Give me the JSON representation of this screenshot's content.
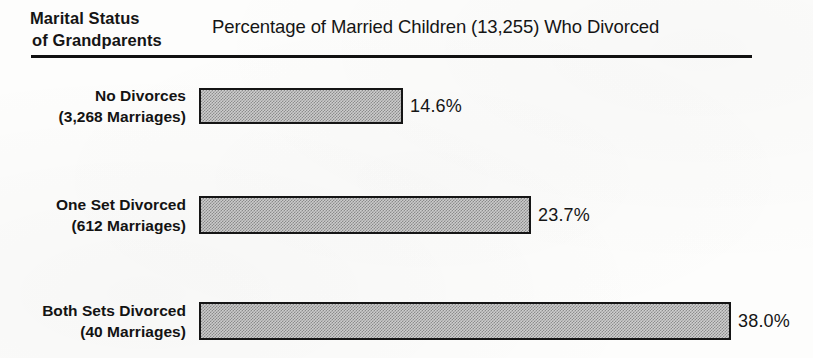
{
  "figure": {
    "row_header": {
      "line1": "Marital Status",
      "line2": "of Grandparents"
    },
    "value_header": "Percentage of Married Children (13,255) Who Divorced",
    "rows": [
      {
        "label_line1": "No Divorces",
        "label_line2": "(3,268 Marriages)",
        "value_label": "14.6%"
      },
      {
        "label_line1": "One Set Divorced",
        "label_line2": "(612 Marriages)",
        "value_label": "23.7%"
      },
      {
        "label_line1": "Both Sets Divorced",
        "label_line2": "(40 Marriages)",
        "value_label": "38.0%"
      }
    ]
  },
  "chart_data": {
    "type": "bar",
    "orientation": "horizontal",
    "title": "Percentage of Married Children (13,255) Who Divorced",
    "category_axis_title": "Marital Status of Grandparents",
    "xlabel": "Percentage of Married Children (13,255) Who Divorced",
    "ylabel": "Marital Status of Grandparents",
    "categories": [
      "No Divorces (3,268 Marriages)",
      "One Set Divorced (612 Marriages)",
      "Both Sets Divorced (40 Marriages)"
    ],
    "values": [
      14.6,
      23.7,
      38.0
    ],
    "data_labels": [
      "14.6%",
      "23.7%",
      "38.0%"
    ],
    "group_sizes": [
      3268,
      612,
      40
    ],
    "total_married_children": 13255,
    "units": "percent",
    "xlim": [
      0,
      38.0
    ],
    "grid": false,
    "legend": "none",
    "colors": {
      "bar_fill": "#cfcfcf",
      "bar_pattern": "#8d8d8d",
      "bar_outline": "#151515",
      "text": "#151515",
      "background": "#fdfdfc",
      "rule": "#111111"
    },
    "pixels_per_percent": 14.0
  },
  "artifacts": {
    "bleed_through_ghost": " "
  }
}
